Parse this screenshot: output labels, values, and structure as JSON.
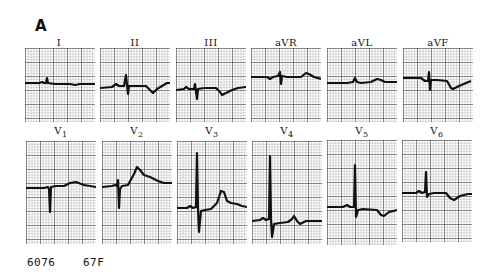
{
  "figure": {
    "panel_label": "A",
    "footer": {
      "id_number": "6076",
      "patient_info": "67F"
    }
  },
  "leads_top_row": [
    {
      "name": "I",
      "sub": ""
    },
    {
      "name": "II",
      "sub": ""
    },
    {
      "name": "III",
      "sub": ""
    },
    {
      "name": "aVR",
      "sub": ""
    },
    {
      "name": "aVL",
      "sub": ""
    },
    {
      "name": "aVF",
      "sub": ""
    }
  ],
  "leads_bottom_row": [
    {
      "name": "V",
      "sub": "1"
    },
    {
      "name": "V",
      "sub": "2"
    },
    {
      "name": "V",
      "sub": "3"
    },
    {
      "name": "V",
      "sub": "4"
    },
    {
      "name": "V",
      "sub": "5"
    },
    {
      "name": "V",
      "sub": "6"
    }
  ],
  "colors": {
    "trace": "#111111",
    "grid_minor": "#8a8a8a",
    "grid_major": "#2a2a2a",
    "paper": "#ffffff"
  }
}
